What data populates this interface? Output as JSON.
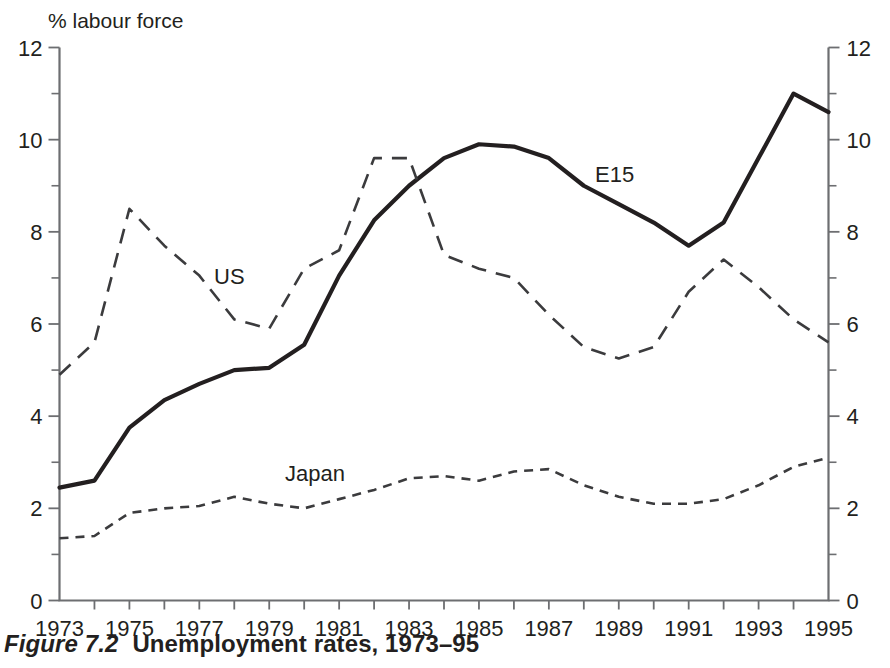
{
  "figure": {
    "caption_label": "Figure 7.2",
    "caption_title": "Unemployment rates, 1973–95"
  },
  "axis": {
    "y_axis_title": "% labour force",
    "y_ticks_left": [
      "0",
      "2",
      "4",
      "6",
      "8",
      "10",
      "12"
    ],
    "y_ticks_right": [
      "0",
      "2",
      "4",
      "6",
      "8",
      "10",
      "12"
    ],
    "x_ticks": [
      "1973",
      "1975",
      "1977",
      "1979",
      "1981",
      "1983",
      "1985",
      "1987",
      "1989",
      "1991",
      "1993",
      "1995"
    ]
  },
  "series_labels": {
    "us": "US",
    "e15": "E15",
    "japan": "Japan"
  },
  "chart_data": {
    "type": "line",
    "title": "Unemployment rates, 1973–95",
    "xlabel": "",
    "ylabel": "% labour force",
    "xlim": [
      1973,
      1995
    ],
    "ylim": [
      0,
      12
    ],
    "grid": false,
    "legend": "inline-annotations",
    "x": [
      1973,
      1974,
      1975,
      1976,
      1977,
      1978,
      1979,
      1980,
      1981,
      1982,
      1983,
      1984,
      1985,
      1986,
      1987,
      1988,
      1989,
      1990,
      1991,
      1992,
      1993,
      1994,
      1995
    ],
    "series": [
      {
        "name": "E15",
        "style": "solid",
        "values": [
          2.45,
          2.6,
          3.75,
          4.35,
          4.7,
          5.0,
          5.05,
          5.55,
          7.05,
          8.25,
          9.0,
          9.6,
          9.9,
          9.85,
          9.6,
          9.0,
          8.6,
          8.2,
          7.7,
          8.2,
          9.6,
          11.0,
          10.6
        ]
      },
      {
        "name": "US",
        "style": "dashed",
        "values": [
          4.9,
          5.6,
          8.5,
          7.7,
          7.05,
          6.1,
          5.9,
          7.2,
          7.6,
          9.6,
          9.6,
          7.5,
          7.2,
          7.0,
          6.2,
          5.5,
          5.25,
          5.5,
          6.7,
          7.4,
          6.8,
          6.1,
          5.6
        ]
      },
      {
        "name": "Japan",
        "style": "dotted",
        "values": [
          1.35,
          1.4,
          1.9,
          2.0,
          2.05,
          2.25,
          2.1,
          2.0,
          2.2,
          2.4,
          2.65,
          2.7,
          2.6,
          2.8,
          2.85,
          2.5,
          2.25,
          2.1,
          2.1,
          2.2,
          2.5,
          2.9,
          3.1
        ]
      }
    ]
  }
}
